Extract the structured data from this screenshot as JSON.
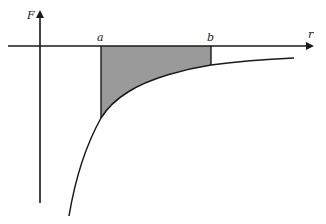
{
  "diagram": {
    "type": "force-vs-distance graph with shaded area",
    "axes": {
      "y_label": "F",
      "x_label": "r"
    },
    "markers": {
      "a_label": "a",
      "b_label": "b"
    },
    "colors": {
      "line": "#1a1a1a",
      "shade": "#9a9a9a",
      "background": "#ffffff"
    }
  }
}
